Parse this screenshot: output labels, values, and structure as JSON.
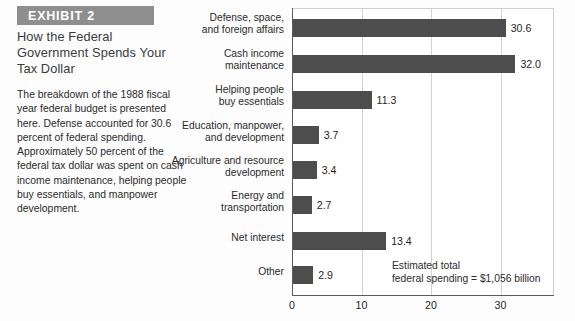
{
  "exhibit": {
    "banner_label": "EXHIBIT 2",
    "title": "How the Federal Government Spends Your Tax Dollar",
    "body": "The breakdown of the 1988 fiscal year federal budget is presented here. Defense accounted for 30.6 percent of federal spending. Approximately 50 percent of the federal tax dollar was spent on cash income maintenance, helping people buy essentials, and manpower development."
  },
  "colors": {
    "banner_background": "#8e8e8e",
    "banner_text": "#ffffff",
    "bar": "#4d4d4d",
    "axis": "#5c5c5c",
    "gridline": "#d2d2d2",
    "page_background": "#ffffff"
  },
  "chart_data": {
    "type": "bar",
    "orientation": "horizontal",
    "title": "",
    "xlabel": "",
    "ylabel": "",
    "xlim": [
      0,
      38
    ],
    "grid": true,
    "legend": null,
    "xticks": [
      "0",
      "10",
      "20",
      "30"
    ],
    "xtick_values": [
      0,
      10,
      20,
      30
    ],
    "categories": [
      "Defense, space, and foreign affairs",
      "Cash income maintenance",
      "Helping people buy essentials",
      "Education, manpower, and development",
      "Agriculture and resource development",
      "Energy and transportation",
      "Net interest",
      "Other"
    ],
    "category_lines": [
      [
        "Defense, space,",
        "and foreign affairs"
      ],
      [
        "Cash income",
        "maintenance"
      ],
      [
        "Helping people",
        "buy essentials"
      ],
      [
        "Education, manpower,",
        "and development"
      ],
      [
        "Agriculture and resource",
        "development"
      ],
      [
        "Energy and",
        "transportation"
      ],
      [
        "Net interest"
      ],
      [
        "Other"
      ]
    ],
    "values": [
      30.6,
      32.0,
      11.3,
      3.7,
      3.4,
      2.7,
      13.4,
      2.9
    ],
    "value_labels": [
      "30.6",
      "32.0",
      "11.3",
      "3.7",
      "3.4",
      "2.7",
      "13.4",
      "2.9"
    ],
    "annotation": [
      "Estimated total",
      "federal spending = $1,056 billion"
    ]
  }
}
